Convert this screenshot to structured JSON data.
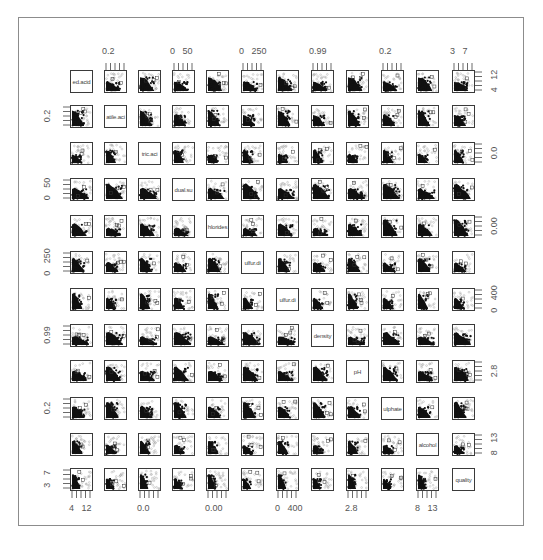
{
  "chart_data": {
    "type": "scatter",
    "subtype": "scatterplot-matrix",
    "title": "",
    "variables": [
      "fixed.acidity",
      "volatile.acidity",
      "citric.acid",
      "residual.sugar",
      "chlorides",
      "free.sulfur.dioxide",
      "total.sulfur.dioxide",
      "density",
      "pH",
      "sulphates",
      "alcohol",
      "quality"
    ],
    "diagonal_labels_visible": [
      "ed.acid",
      "atile.aci",
      "tric.aci",
      "dual.su",
      "hlorides",
      "ulfur.di",
      "ulfur.di",
      "density",
      "pH",
      "ulphate",
      "alcohol",
      "quality"
    ],
    "top_axis_labels": [
      {
        "column": 1,
        "text": "0.2"
      },
      {
        "column": 3,
        "text": "0   50"
      },
      {
        "column": 5,
        "text": "0   250"
      },
      {
        "column": 7,
        "text": "0.99"
      },
      {
        "column": 9,
        "text": "0.2"
      },
      {
        "column": 11,
        "text": "3   7"
      }
    ],
    "bottom_axis_labels": [
      {
        "column": 0,
        "text": "4   12"
      },
      {
        "column": 2,
        "text": "0.0"
      },
      {
        "column": 4,
        "text": "0.00"
      },
      {
        "column": 6,
        "text": "0   400"
      },
      {
        "column": 8,
        "text": "2.8"
      },
      {
        "column": 10,
        "text": "8   13"
      }
    ],
    "left_axis_labels": [
      {
        "row": 1,
        "text": "0.2"
      },
      {
        "row": 3,
        "text": "0   50"
      },
      {
        "row": 5,
        "text": "0   250"
      },
      {
        "row": 7,
        "text": "0.99"
      },
      {
        "row": 9,
        "text": "0.2"
      },
      {
        "row": 11,
        "text": "3   7"
      }
    ],
    "right_axis_labels": [
      {
        "row": 0,
        "text": "4   12"
      },
      {
        "row": 2,
        "text": "0.0"
      },
      {
        "row": 4,
        "text": "0.00"
      },
      {
        "row": 6,
        "text": "0   400"
      },
      {
        "row": 8,
        "text": "2.8"
      },
      {
        "row": 10,
        "text": "8   13"
      }
    ],
    "grid": false,
    "legend": "none",
    "point_style": "dense black clusters with gray overplotting, small square outlier markers"
  },
  "colors": {
    "point_dense": "#111111",
    "point_light": "#a0a0a0",
    "panel_border": "#3a3a3a",
    "frame_border": "#8c8c8c",
    "text": "#555555"
  }
}
